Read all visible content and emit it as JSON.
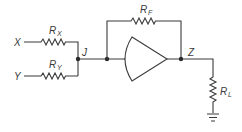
{
  "diagram": {
    "type": "circuit",
    "labels": {
      "input_x": "X",
      "input_y": "Y",
      "junction": "J",
      "output": "Z",
      "rx_main": "R",
      "rx_sub": "X",
      "ry_main": "R",
      "ry_sub": "Y",
      "rf_main": "R",
      "rf_sub": "F",
      "rl_main": "R",
      "rl_sub": "L"
    },
    "components": [
      {
        "id": "RX",
        "kind": "resistor",
        "from": "X",
        "to": "J"
      },
      {
        "id": "RY",
        "kind": "resistor",
        "from": "Y",
        "to": "J"
      },
      {
        "id": "amp",
        "kind": "amplifier",
        "from": "J",
        "to": "Z"
      },
      {
        "id": "RF",
        "kind": "resistor",
        "from": "J",
        "to": "Z",
        "role": "feedback"
      },
      {
        "id": "RL",
        "kind": "resistor",
        "from": "Z",
        "to": "ground",
        "role": "load"
      }
    ],
    "colors": {
      "line": "#3a3a3a",
      "background": "#ffffff"
    }
  }
}
